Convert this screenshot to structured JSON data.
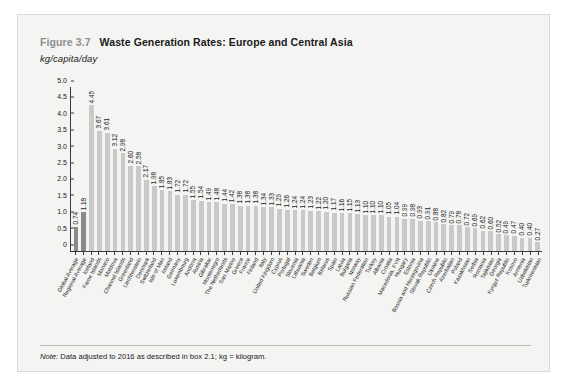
{
  "figure": {
    "number": "Figure 3.7",
    "title": "Waste Generation Rates: Europe and Central Asia",
    "subtitle": "kg/capita/day",
    "note_label": "Note:",
    "note_text": " Data adjusted to 2016 as described in box 2.1; kg = kilogram."
  },
  "chart_data": {
    "type": "bar",
    "title": "Waste Generation Rates: Europe and Central Asia",
    "subtitle": "kg/capita/day",
    "xlabel": "",
    "ylabel": "kg/capita/day",
    "ylim": [
      0,
      5.0
    ],
    "yticks": [
      "0",
      "0.5",
      "1.0",
      "1.5",
      "2.0",
      "2.5",
      "3.0",
      "3.5",
      "4.0",
      "4.5",
      "5.0"
    ],
    "ytick_values": [
      0,
      0.5,
      1.0,
      1.5,
      2.0,
      2.5,
      3.0,
      3.5,
      4.0,
      4.5,
      5.0
    ],
    "grid": false,
    "legend": false,
    "accent_color": "#8a8a8a",
    "bar_color": "#c9c9c9",
    "accent_indices": [
      0,
      1
    ],
    "categories": [
      "Global Average",
      "Regional Average",
      "Iceland",
      "Faroe Islands",
      "Monaco",
      "Moldova",
      "Channel Islands",
      "Greenland",
      "Liechtenstein",
      "Denmark",
      "Switzerland",
      "Isle of Man",
      "Ireland",
      "Germany",
      "Luxembourg",
      "Andorra",
      "Austria",
      "Gibraltar",
      "Montenegro",
      "The Netherlands",
      "San Marino",
      "Greece",
      "France",
      "Finland",
      "Italy",
      "United Kingdom",
      "Cyprus",
      "Portugal",
      "Slovenia",
      "Lithuania",
      "Sweden",
      "Belgium",
      "Belarus",
      "Spain",
      "Latvia",
      "Bulgaria",
      "Norway",
      "Russian Federation",
      "Turkey",
      "Albania",
      "Croatia",
      "Macedonia, FYR",
      "Hungary",
      "Estonia",
      "Bosnia and Herzegovina",
      "Slovak Republic",
      "Ukraine",
      "Czech Republic",
      "Azerbaijan",
      "Poland",
      "Kazakhstan",
      "Serbia",
      "Romania",
      "Tajikistan",
      "Georgia",
      "Kyrgyz Republic",
      "Kosovo",
      "Armenia",
      "Uzbekistan",
      "Turkmenistan"
    ],
    "values": [
      0.74,
      1.18,
      4.45,
      3.67,
      3.61,
      3.12,
      2.98,
      2.6,
      2.58,
      2.17,
      1.98,
      1.85,
      1.83,
      1.72,
      1.72,
      1.55,
      1.54,
      1.49,
      1.48,
      1.44,
      1.42,
      1.38,
      1.38,
      1.38,
      1.34,
      1.33,
      1.29,
      1.26,
      1.24,
      1.24,
      1.23,
      1.22,
      1.2,
      1.17,
      1.16,
      1.15,
      1.13,
      1.1,
      1.1,
      1.1,
      1.05,
      1.04,
      0.99,
      0.98,
      0.93,
      0.91,
      0.88,
      0.82,
      0.79,
      0.78,
      0.72,
      0.69,
      0.62,
      0.6,
      0.52,
      0.49,
      0.47,
      0.4,
      0.4,
      0.27
    ],
    "value_labels": [
      "0.74",
      "1.18",
      "4.45",
      "3.67",
      "3.61",
      "3.12",
      "2.98",
      "2.60",
      "2.58",
      "2.17",
      "1.98",
      "1.85",
      "1.83",
      "1.72",
      "1.72",
      "1.55",
      "1.54",
      "1.49",
      "1.48",
      "1.44",
      "1.42",
      "1.38",
      "1.38",
      "1.38",
      "1.34",
      "1.33",
      "1.29",
      "1.26",
      "1.24",
      "1.24",
      "1.23",
      "1.22",
      "1.20",
      "1.17",
      "1.16",
      "1.15",
      "1.13",
      "1.10",
      "1.10",
      "1.10",
      "1.05",
      "1.04",
      "0.99",
      "0.98",
      "0.93",
      "0.91",
      "0.88",
      "0.82",
      "0.79",
      "0.78",
      "0.72",
      "0.69",
      "0.62",
      "0.60",
      "0.52",
      "0.49",
      "0.47",
      "0.40",
      "0.40",
      "0.27"
    ]
  }
}
